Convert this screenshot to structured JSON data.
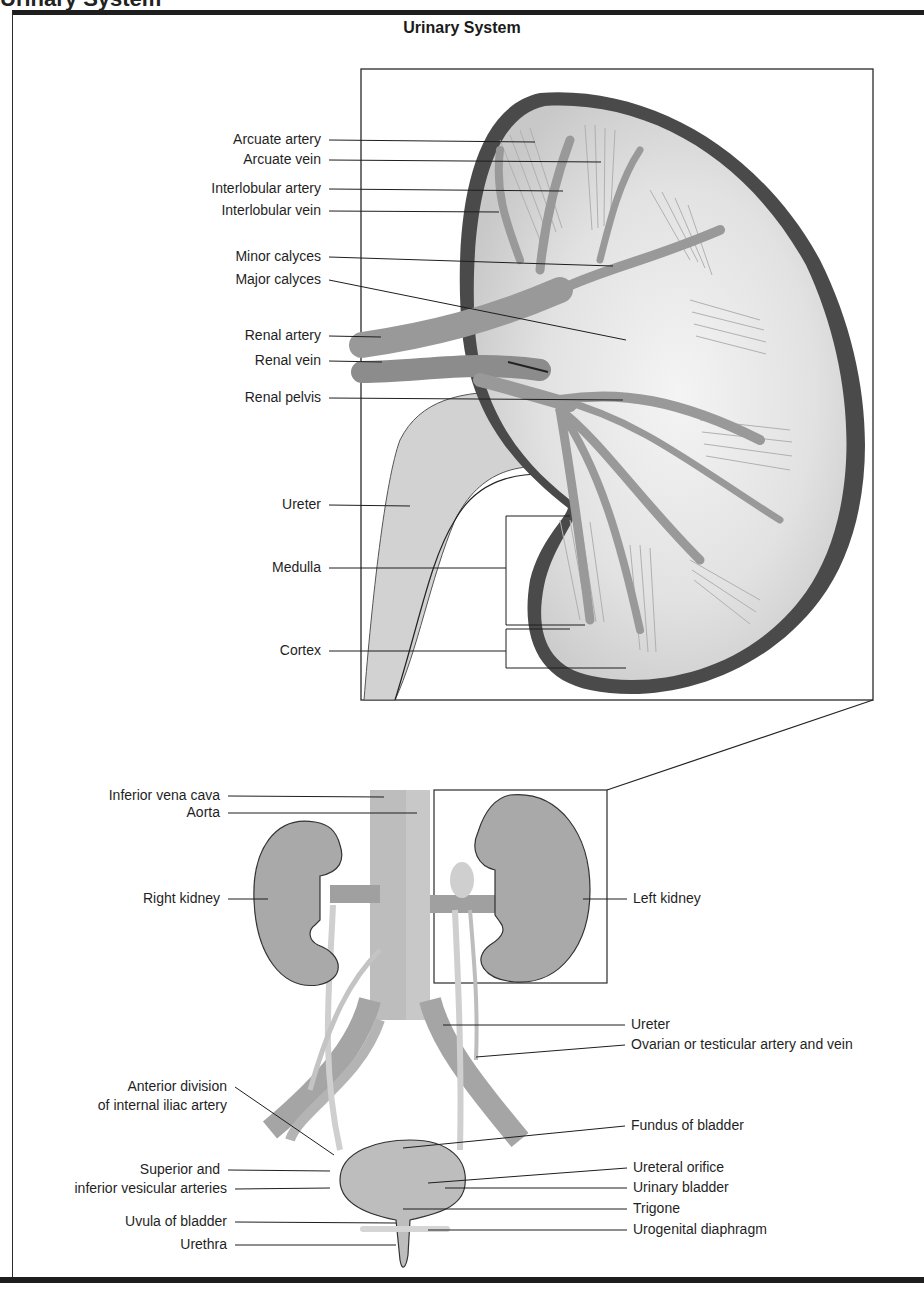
{
  "page": {
    "cut_title": "Urinary System",
    "title": "Urinary System"
  },
  "kidney_section": {
    "labels": [
      {
        "text": "Arcuate artery",
        "x": 329,
        "y": 140,
        "tx": 535,
        "ty": 142
      },
      {
        "text": "Arcuate vein",
        "x": 329,
        "y": 160,
        "tx": 601,
        "ty": 162
      },
      {
        "text": "Interlobular artery",
        "x": 329,
        "y": 189,
        "tx": 563,
        "ty": 191
      },
      {
        "text": "Interlobular vein",
        "x": 329,
        "y": 211,
        "tx": 499,
        "ty": 212
      },
      {
        "text": "Minor calyces",
        "x": 329,
        "y": 257,
        "tx": 613,
        "ty": 266
      },
      {
        "text": "Major calyces",
        "x": 329,
        "y": 280,
        "tx": 626,
        "ty": 340
      },
      {
        "text": "Renal artery",
        "x": 329,
        "y": 336,
        "tx": 381,
        "ty": 337
      },
      {
        "text": "Renal vein",
        "x": 329,
        "y": 361,
        "tx": 382,
        "ty": 362
      },
      {
        "text": "Renal pelvis",
        "x": 329,
        "y": 398,
        "tx": 623,
        "ty": 400
      },
      {
        "text": "Ureter",
        "x": 329,
        "y": 505,
        "tx": 410,
        "ty": 506
      },
      {
        "text": "Medulla",
        "x": 329,
        "y": 568,
        "tx": 506,
        "ty": 568
      },
      {
        "text": "Cortex",
        "x": 329,
        "y": 651,
        "tx": 506,
        "ty": 651
      }
    ],
    "brackets": [
      {
        "name": "medulla-bracket",
        "x": 506,
        "y1": 516,
        "y2": 625,
        "right_top": 570,
        "right_bottom": 585
      },
      {
        "name": "cortex-bracket",
        "x": 506,
        "y1": 629,
        "y2": 668,
        "right_top": 570,
        "right_bottom": 626
      }
    ]
  },
  "overview": {
    "left_labels": [
      {
        "text": "Inferior vena cava",
        "x": 228,
        "y": 796,
        "tx": 384,
        "ty": 797
      },
      {
        "text": "Aorta",
        "x": 228,
        "y": 813,
        "tx": 417,
        "ty": 813
      },
      {
        "text": "Right kidney",
        "x": 228,
        "y": 899,
        "tx": 268,
        "ty": 899
      },
      {
        "text": "Anterior division",
        "x": 235,
        "y": 1087,
        "tx": 334,
        "ty": 1155
      },
      {
        "text": "of internal iliac artery",
        "x": 235,
        "y": 1106,
        "tx": null,
        "ty": null
      },
      {
        "text": "Superior and",
        "x": 228,
        "y": 1170,
        "tx": 330,
        "ty": 1171
      },
      {
        "text": "inferior vesicular arteries",
        "x": 235,
        "y": 1189,
        "tx": 330,
        "ty": 1188
      },
      {
        "text": "Uvula of bladder",
        "x": 235,
        "y": 1222,
        "tx": 396,
        "ty": 1223
      },
      {
        "text": "Urethra",
        "x": 235,
        "y": 1245,
        "tx": 396,
        "ty": 1245
      }
    ],
    "right_labels": [
      {
        "text": "Left kidney",
        "x": 633,
        "y": 899,
        "tx": 583,
        "ty": 899
      },
      {
        "text": "Ureter",
        "x": 631,
        "y": 1025,
        "tx": 443,
        "ty": 1025
      },
      {
        "text": "Ovarian or testicular artery and vein",
        "x": 631,
        "y": 1045,
        "tx": 476,
        "ty": 1057
      },
      {
        "text": "Fundus of bladder",
        "x": 631,
        "y": 1126,
        "tx": 403,
        "ty": 1148
      },
      {
        "text": "Ureteral orifice",
        "x": 633,
        "y": 1168,
        "tx": 428,
        "ty": 1183
      },
      {
        "text": "Urinary bladder",
        "x": 633,
        "y": 1188,
        "tx": 445,
        "ty": 1188
      },
      {
        "text": "Trigone",
        "x": 633,
        "y": 1209,
        "tx": 403,
        "ty": 1209
      },
      {
        "text": "Urogenital diaphragm",
        "x": 633,
        "y": 1230,
        "tx": 428,
        "ty": 1230
      }
    ]
  },
  "colors": {
    "capsule": "#4a4a4a",
    "tissue": "#d9d9d9",
    "vessel": "#9a9a9a",
    "kidney_fill": "#a8a8a8",
    "line": "#1e1e1e"
  }
}
